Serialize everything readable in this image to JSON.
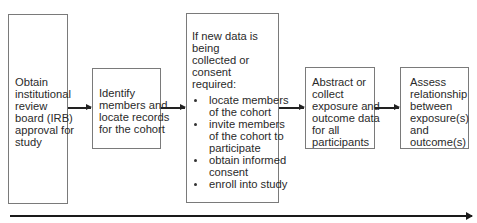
{
  "diagram": {
    "type": "flowchart",
    "direction": "left-to-right",
    "boxes": [
      {
        "id": "irb-approval",
        "lines": [
          "Obtain",
          "institutional",
          "review",
          "board (IRB)",
          "approval for",
          "study"
        ]
      },
      {
        "id": "identify-members",
        "lines": [
          "Identify",
          "members and",
          "locate records",
          "for the cohort"
        ]
      },
      {
        "id": "new-data-consent",
        "lines": [
          "If new data is",
          "being",
          "collected or",
          "consent",
          "required:"
        ],
        "bullets": [
          {
            "lines": [
              "locate members",
              "of the cohort"
            ]
          },
          {
            "lines": [
              "invite members",
              "of the cohort to",
              "participate"
            ]
          },
          {
            "lines": [
              "obtain informed",
              "consent"
            ]
          },
          {
            "lines": [
              "enroll into study"
            ]
          }
        ]
      },
      {
        "id": "abstract-collect",
        "lines": [
          "Abstract or",
          "collect",
          "exposure and",
          "outcome data",
          "for all",
          "participants"
        ]
      },
      {
        "id": "assess-relationship",
        "lines": [
          "Assess",
          "relationship",
          "between",
          "exposure(s)",
          "and",
          "outcome(s)"
        ]
      }
    ],
    "edges": [
      {
        "from": "irb-approval",
        "to": "identify-members"
      },
      {
        "from": "identify-members",
        "to": "new-data-consent"
      },
      {
        "from": "new-data-consent",
        "to": "abstract-collect"
      },
      {
        "from": "abstract-collect",
        "to": "assess-relationship"
      }
    ],
    "timeline_arrow": true,
    "colors": {
      "border": "#7a7a7a",
      "arrow": "#222222",
      "text": "#2a2a2a",
      "background": "#ffffff"
    }
  }
}
